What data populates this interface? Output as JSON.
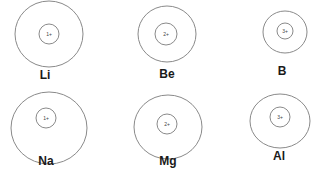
{
  "stroke_color": "#8a8a8a",
  "ions": [
    {
      "element": "Li",
      "charge": "1+",
      "outer": {
        "cx": 49,
        "cy": 34,
        "rx": 34,
        "ry": 33
      },
      "inner": {
        "cx": 49,
        "cy": 34,
        "r": 10
      },
      "label_pos": {
        "x": 45,
        "y": 69
      }
    },
    {
      "element": "Be",
      "charge": "2+",
      "outer": {
        "cx": 167,
        "cy": 34,
        "rx": 29,
        "ry": 28
      },
      "inner": {
        "cx": 166,
        "cy": 34,
        "r": 11
      },
      "label_pos": {
        "x": 167,
        "y": 68
      }
    },
    {
      "element": "B",
      "charge": "3+",
      "outer": {
        "cx": 285,
        "cy": 32,
        "rx": 22,
        "ry": 21
      },
      "inner": {
        "cx": 285,
        "cy": 31,
        "r": 8
      },
      "label_pos": {
        "x": 282,
        "y": 65
      }
    },
    {
      "element": "Na",
      "charge": "1+",
      "outer": {
        "cx": 49,
        "cy": 128,
        "rx": 38,
        "ry": 36
      },
      "inner": {
        "cx": 46,
        "cy": 118,
        "r": 10
      },
      "label_pos": {
        "x": 46,
        "y": 155
      }
    },
    {
      "element": "Mg",
      "charge": "2+",
      "outer": {
        "cx": 168,
        "cy": 127,
        "rx": 34,
        "ry": 32
      },
      "inner": {
        "cx": 167,
        "cy": 124,
        "r": 10
      },
      "label_pos": {
        "x": 168,
        "y": 155
      }
    },
    {
      "element": "Al",
      "charge": "3+",
      "outer": {
        "cx": 280,
        "cy": 121,
        "rx": 30,
        "ry": 27
      },
      "inner": {
        "cx": 280,
        "cy": 117,
        "r": 10
      },
      "label_pos": {
        "x": 279,
        "y": 150
      }
    }
  ]
}
